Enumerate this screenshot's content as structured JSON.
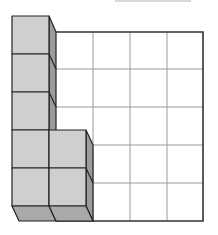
{
  "diagram": {
    "grid": {
      "columns": 4,
      "rows": 5,
      "line_color": "#9a9a9a",
      "border_color": "#333333"
    },
    "cube_stacks": [
      {
        "column": 1,
        "height": 5
      },
      {
        "column": 2,
        "height": 2
      }
    ],
    "colors": {
      "front_face": "#cfcfcf",
      "side_face": "#9c9c9c",
      "bottom_face": "#a9a9a9",
      "edge": "#222222",
      "background": "#ffffff"
    }
  }
}
